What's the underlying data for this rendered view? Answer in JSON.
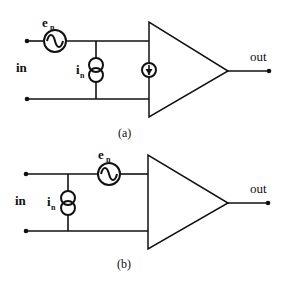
{
  "figure": {
    "diagram_a": {
      "caption": "(a)",
      "input_label": "in",
      "output_label": "out",
      "voltage_source": {
        "symbol": "e",
        "subscript": "n"
      },
      "current_source": {
        "symbol": "i",
        "subscript": "n"
      },
      "components": [
        "voltage-noise-source",
        "current-noise-source",
        "internal-current-source",
        "amplifier"
      ]
    },
    "diagram_b": {
      "caption": "(b)",
      "input_label": "in",
      "output_label": "out",
      "voltage_source": {
        "symbol": "e",
        "subscript": "n"
      },
      "current_source": {
        "symbol": "i",
        "subscript": "n"
      },
      "components": [
        "current-noise-source",
        "voltage-noise-source",
        "amplifier"
      ]
    }
  }
}
